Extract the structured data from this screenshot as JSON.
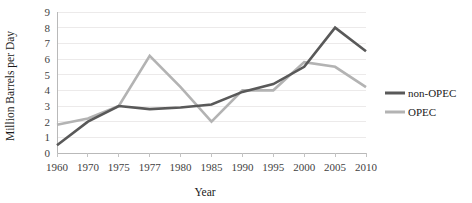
{
  "chart_data": {
    "type": "line",
    "title": "",
    "xlabel": "Year",
    "ylabel": "Million Barrels per Day",
    "categories": [
      "1960",
      "1970",
      "1975",
      "1977",
      "1980",
      "1985",
      "1990",
      "1995",
      "2000",
      "2005",
      "2010"
    ],
    "ylim": [
      0,
      9
    ],
    "yticks": [
      "0",
      "1",
      "2",
      "3",
      "4",
      "5",
      "6",
      "7",
      "8",
      "9"
    ],
    "grid": true,
    "legend_position": "right",
    "series": [
      {
        "name": "non-OPEC",
        "color": "#595959",
        "values": [
          0.5,
          2.0,
          3.0,
          2.8,
          2.9,
          3.1,
          3.9,
          4.4,
          5.5,
          8.0,
          6.5
        ]
      },
      {
        "name": "OPEC",
        "color": "#b3b3b3",
        "values": [
          1.8,
          2.2,
          3.0,
          6.2,
          4.2,
          2.0,
          4.0,
          4.0,
          5.8,
          5.5,
          4.2
        ]
      }
    ]
  },
  "axis": {
    "x_title": "Year",
    "y_title": "Million Barrels per Day"
  },
  "legend": {
    "items": [
      {
        "label": "non-OPEC",
        "color": "#595959"
      },
      {
        "label": "OPEC",
        "color": "#b3b3b3"
      }
    ]
  }
}
